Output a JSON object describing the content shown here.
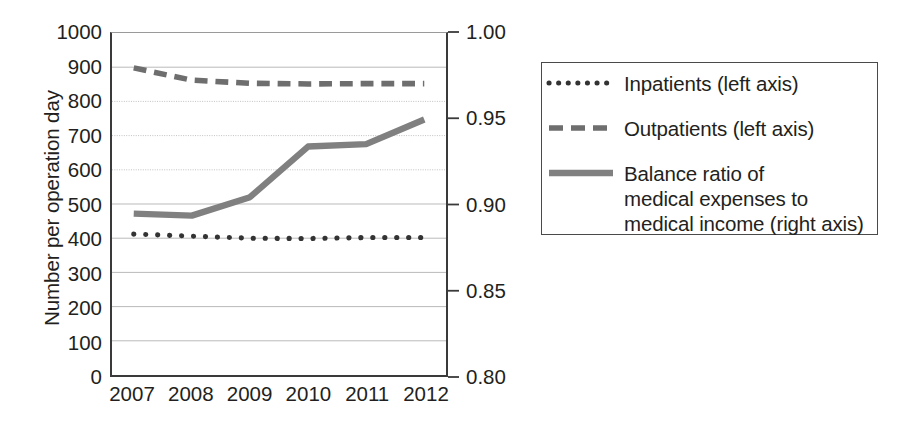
{
  "chart_data": {
    "type": "line",
    "title": "",
    "xlabel": "",
    "ylabel": "Number per operation day",
    "y2label": "",
    "categories": [
      "2007",
      "2008",
      "2009",
      "2010",
      "2011",
      "2012"
    ],
    "x": [
      2007,
      2008,
      2009,
      2010,
      2011,
      2012
    ],
    "ylim": [
      0,
      1000
    ],
    "y2lim": [
      0.8,
      1.0
    ],
    "yticks": [
      0,
      100,
      200,
      300,
      400,
      500,
      600,
      700,
      800,
      900,
      1000
    ],
    "ytick_labels": [
      "0",
      "100",
      "200",
      "300",
      "400",
      "500",
      "600",
      "700",
      "800",
      "900",
      "1000"
    ],
    "y2ticks": [
      0.8,
      0.85,
      0.9,
      0.95,
      1.0
    ],
    "y2tick_labels": [
      "0.80",
      "0.85",
      "0.90",
      "0.95",
      "1.00"
    ],
    "grid": true,
    "grid_axis": "y",
    "legend_position": "right-outside",
    "series": [
      {
        "name": "Inpatients (left axis)",
        "axis": "left",
        "style": "dotted",
        "color": "#333333",
        "values": [
          412,
          406,
          400,
          399,
          402,
          402
        ]
      },
      {
        "name": "Outpatients (left axis)",
        "axis": "left",
        "style": "dashed",
        "color": "#6e6e6e",
        "values": [
          898,
          862,
          853,
          851,
          852,
          852
        ]
      },
      {
        "name": "Balance ratio of\nmedical expenses to\nmedical income (right axis)",
        "axis": "right",
        "style": "solid",
        "color": "#808080",
        "values": [
          0.894,
          0.893,
          0.904,
          0.934,
          0.935,
          0.949
        ],
        "values_left_scale": [
          472,
          466,
          520,
          668,
          675,
          747
        ]
      }
    ]
  },
  "axes": {
    "left_title": "Number per operation day",
    "left_ticks": [
      "1000",
      "900",
      "800",
      "700",
      "600",
      "500",
      "400",
      "300",
      "200",
      "100",
      "0"
    ],
    "right_ticks": [
      "1.00",
      "0.95",
      "0.90",
      "0.85",
      "0.80"
    ],
    "x_ticks": [
      "2007",
      "2008",
      "2009",
      "2010",
      "2011",
      "2012"
    ]
  },
  "legend": {
    "items": [
      {
        "sample": "dotted-line-sample",
        "label": "Inpatients (left axis)"
      },
      {
        "sample": "dashed-line-sample",
        "label": "Outpatients (left axis)"
      },
      {
        "sample": "solid-line-sample",
        "label": "Balance ratio of\nmedical expenses to\nmedical income (right axis)"
      }
    ]
  },
  "colors": {
    "inpatients": "#333333",
    "outpatients": "#6e6e6e",
    "balance_ratio": "#808080",
    "axis": "#3a3a3a",
    "grid": "#b9b9b9",
    "text": "#231f20"
  }
}
